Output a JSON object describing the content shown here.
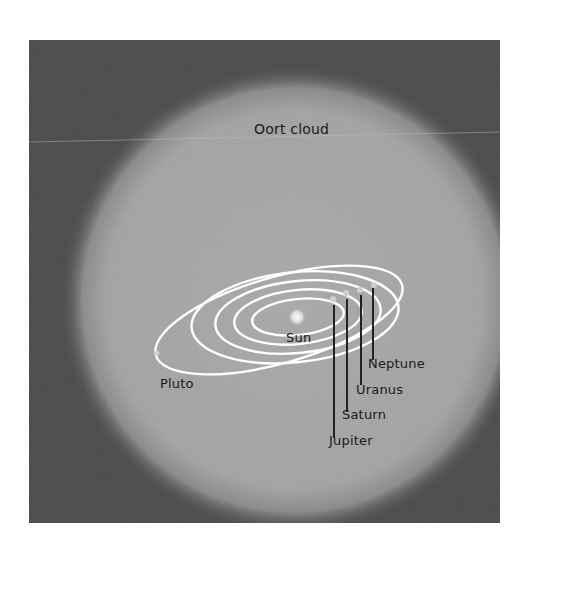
{
  "diagram": {
    "title_label": "Oort cloud",
    "center_label": "Sun",
    "planets": [
      {
        "name": "Jupiter"
      },
      {
        "name": "Saturn"
      },
      {
        "name": "Uranus"
      },
      {
        "name": "Neptune"
      },
      {
        "name": "Pluto"
      }
    ],
    "colors": {
      "background": "#4a4a4a",
      "cloud": "#a8a8a8",
      "orbits": "#ffffff",
      "text": "#1a1a1a",
      "leader_lines": "#222222"
    }
  }
}
